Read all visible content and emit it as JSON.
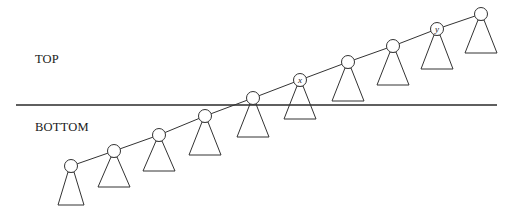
{
  "diagram": {
    "regions": {
      "top_label": "TOP",
      "bottom_label": "BOTTOM"
    },
    "divider": {
      "x1": 16,
      "x2": 497,
      "y": 105,
      "color": "#2a2a2a"
    },
    "spine_color": "#333333",
    "node_radius": 6.5,
    "nodes": [
      {
        "id": 1,
        "cx": 71,
        "cy": 166,
        "label": "",
        "tri_top": 172,
        "tri_bottom": 205,
        "tri_half_width": 13
      },
      {
        "id": 2,
        "cx": 114,
        "cy": 151,
        "label": "",
        "tri_top": 157,
        "tri_bottom": 187,
        "tri_half_width": 16
      },
      {
        "id": 3,
        "cx": 159,
        "cy": 135,
        "label": "",
        "tri_top": 141,
        "tri_bottom": 171,
        "tri_half_width": 16
      },
      {
        "id": 4,
        "cx": 205,
        "cy": 116,
        "label": "",
        "tri_top": 122,
        "tri_bottom": 155,
        "tri_half_width": 16
      },
      {
        "id": 5,
        "cx": 253,
        "cy": 98,
        "label": "",
        "tri_top": 104,
        "tri_bottom": 137,
        "tri_half_width": 16
      },
      {
        "id": 6,
        "cx": 300,
        "cy": 80,
        "label": "x",
        "tri_top": 86,
        "tri_bottom": 119,
        "tri_half_width": 16
      },
      {
        "id": 7,
        "cx": 348,
        "cy": 62,
        "label": "",
        "tri_top": 68,
        "tri_bottom": 101,
        "tri_half_width": 16
      },
      {
        "id": 8,
        "cx": 393,
        "cy": 46,
        "label": "",
        "tri_top": 52,
        "tri_bottom": 85,
        "tri_half_width": 16
      },
      {
        "id": 9,
        "cx": 437,
        "cy": 29,
        "label": "y",
        "tri_top": 35,
        "tri_bottom": 69,
        "tri_half_width": 16
      },
      {
        "id": 10,
        "cx": 481,
        "cy": 14,
        "label": "",
        "tri_top": 20,
        "tri_bottom": 53,
        "tri_half_width": 16
      }
    ]
  }
}
